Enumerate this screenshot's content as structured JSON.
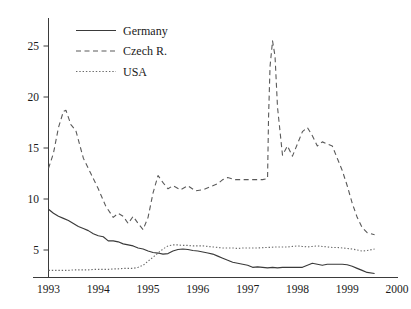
{
  "chart_data": {
    "type": "line",
    "title": "",
    "xlabel": "",
    "ylabel": "",
    "xlim": [
      1993.0,
      2000.0
    ],
    "ylim": [
      2.0,
      27.5
    ],
    "grid": false,
    "legend_position": "top-center-left",
    "xticks": [
      1993,
      1994,
      1995,
      1996,
      1997,
      1998,
      1999,
      2000
    ],
    "xtick_labels": [
      "1993",
      "1994",
      "1995",
      "1996",
      "1997",
      "1998",
      "1999",
      "2000"
    ],
    "yticks": [
      5,
      10,
      15,
      20,
      25
    ],
    "ytick_labels": [
      "5",
      "10",
      "15",
      "20",
      "25"
    ],
    "series": [
      {
        "name": "Germany",
        "style": "solid",
        "color": "#3a3a3a",
        "x": [
          1993.0,
          1993.1,
          1993.2,
          1993.3,
          1993.4,
          1993.5,
          1993.6,
          1993.7,
          1993.8,
          1993.9,
          1994.0,
          1994.1,
          1994.2,
          1994.3,
          1994.4,
          1994.5,
          1994.6,
          1994.7,
          1994.8,
          1994.9,
          1995.0,
          1995.1,
          1995.2,
          1995.3,
          1995.4,
          1995.5,
          1995.6,
          1995.7,
          1995.8,
          1995.9,
          1996.0,
          1996.1,
          1996.2,
          1996.3,
          1996.4,
          1996.5,
          1996.6,
          1996.7,
          1996.8,
          1996.9,
          1997.0,
          1997.1,
          1997.2,
          1997.3,
          1997.4,
          1997.5,
          1997.6,
          1997.7,
          1997.8,
          1997.9,
          1998.0,
          1998.1,
          1998.2,
          1998.3,
          1998.4,
          1998.5,
          1998.6,
          1998.7,
          1998.8,
          1998.9,
          1999.0,
          1999.1,
          1999.2,
          1999.3,
          1999.4,
          1999.55
        ],
        "values": [
          9.0,
          8.6,
          8.3,
          8.1,
          7.9,
          7.6,
          7.3,
          7.1,
          6.9,
          6.6,
          6.4,
          6.3,
          5.9,
          5.9,
          5.8,
          5.6,
          5.5,
          5.4,
          5.2,
          5.1,
          4.9,
          4.75,
          4.7,
          4.6,
          4.65,
          4.9,
          5.05,
          5.1,
          5.05,
          4.95,
          4.9,
          4.8,
          4.7,
          4.6,
          4.4,
          4.2,
          4.0,
          3.8,
          3.7,
          3.6,
          3.5,
          3.3,
          3.35,
          3.3,
          3.25,
          3.3,
          3.25,
          3.3,
          3.3,
          3.3,
          3.3,
          3.3,
          3.5,
          3.7,
          3.6,
          3.5,
          3.6,
          3.6,
          3.6,
          3.6,
          3.55,
          3.4,
          3.2,
          3.0,
          2.8,
          2.7
        ]
      },
      {
        "name": "Czech R.",
        "style": "dashed",
        "color": "#5a5a5a",
        "x": [
          1993.0,
          1993.1,
          1993.2,
          1993.3,
          1993.35,
          1993.45,
          1993.55,
          1993.7,
          1993.85,
          1994.0,
          1994.15,
          1994.3,
          1994.4,
          1994.5,
          1994.6,
          1994.7,
          1994.8,
          1994.9,
          1995.0,
          1995.1,
          1995.2,
          1995.3,
          1995.4,
          1995.5,
          1995.65,
          1995.8,
          1995.95,
          1996.1,
          1996.25,
          1996.4,
          1996.5,
          1996.6,
          1996.75,
          1996.9,
          1997.0,
          1997.15,
          1997.3,
          1997.4,
          1997.42,
          1997.45,
          1997.5,
          1997.55,
          1997.6,
          1997.7,
          1997.8,
          1997.9,
          1998.0,
          1998.1,
          1998.2,
          1998.3,
          1998.4,
          1998.5,
          1998.6,
          1998.7,
          1998.8,
          1998.9,
          1999.0,
          1999.1,
          1999.2,
          1999.3,
          1999.4,
          1999.55
        ],
        "values": [
          13.0,
          14.5,
          17.0,
          18.6,
          18.7,
          17.3,
          16.7,
          14.0,
          12.5,
          11.0,
          9.3,
          8.2,
          8.6,
          8.3,
          7.6,
          8.3,
          7.6,
          7.0,
          8.2,
          10.6,
          12.3,
          11.6,
          11.0,
          11.3,
          10.9,
          11.3,
          10.8,
          10.9,
          11.2,
          11.5,
          11.9,
          12.1,
          11.9,
          11.9,
          11.9,
          11.9,
          11.9,
          12.0,
          18.0,
          23.0,
          25.5,
          24.0,
          19.0,
          14.3,
          15.2,
          14.2,
          15.4,
          16.6,
          17.0,
          16.2,
          15.2,
          15.6,
          15.4,
          15.2,
          14.0,
          12.8,
          11.3,
          9.6,
          8.2,
          7.2,
          6.7,
          6.5
        ]
      },
      {
        "name": "USA",
        "style": "dotted",
        "color": "#6a6a6a",
        "x": [
          1993.0,
          1993.1,
          1993.2,
          1993.3,
          1993.4,
          1993.5,
          1993.6,
          1993.7,
          1993.8,
          1993.9,
          1994.0,
          1994.1,
          1994.2,
          1994.3,
          1994.4,
          1994.5,
          1994.6,
          1994.7,
          1994.8,
          1994.9,
          1995.0,
          1995.1,
          1995.2,
          1995.3,
          1995.4,
          1995.5,
          1995.6,
          1995.7,
          1995.8,
          1995.9,
          1996.0,
          1996.1,
          1996.2,
          1996.3,
          1996.4,
          1996.5,
          1996.6,
          1996.7,
          1996.8,
          1996.9,
          1997.0,
          1997.2,
          1997.4,
          1997.6,
          1997.8,
          1998.0,
          1998.1,
          1998.2,
          1998.3,
          1998.4,
          1998.5,
          1998.6,
          1998.7,
          1998.8,
          1998.9,
          1999.0,
          1999.1,
          1999.2,
          1999.3,
          1999.4,
          1999.55
        ],
        "values": [
          3.0,
          3.0,
          3.0,
          3.0,
          3.0,
          3.05,
          3.05,
          3.05,
          3.05,
          3.1,
          3.1,
          3.1,
          3.1,
          3.15,
          3.15,
          3.2,
          3.2,
          3.2,
          3.3,
          3.5,
          3.9,
          4.3,
          4.7,
          5.1,
          5.4,
          5.5,
          5.5,
          5.45,
          5.45,
          5.4,
          5.4,
          5.4,
          5.35,
          5.3,
          5.25,
          5.2,
          5.2,
          5.2,
          5.15,
          5.2,
          5.2,
          5.2,
          5.25,
          5.3,
          5.3,
          5.4,
          5.35,
          5.3,
          5.35,
          5.4,
          5.35,
          5.3,
          5.25,
          5.25,
          5.2,
          5.15,
          5.1,
          5.0,
          4.9,
          4.95,
          5.1
        ]
      }
    ]
  },
  "legend": {
    "items": [
      {
        "label": "Germany",
        "style": "solid"
      },
      {
        "label": "Czech R.",
        "style": "dashed"
      },
      {
        "label": "USA",
        "style": "dotted"
      }
    ]
  },
  "axes": {
    "y_tick_labels": [
      "25",
      "20",
      "15",
      "10",
      "5"
    ],
    "x_tick_labels": [
      "1993",
      "1994",
      "1995",
      "1996",
      "1997",
      "1998",
      "1999",
      "2000"
    ]
  },
  "colors": {
    "background": "#ffffff",
    "axis": "#3b3b3b",
    "text": "#1a1a1a",
    "germany": "#3a3a3a",
    "czech": "#5a5a5a",
    "usa": "#6a6a6a"
  }
}
